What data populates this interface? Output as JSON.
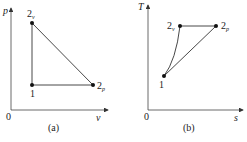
{
  "diagrams": [
    {
      "id": "a",
      "caption": "(a)",
      "y_axis_label": "p",
      "x_axis_label": "v",
      "origin_label": "0",
      "points": [
        {
          "name": "1",
          "base": "1",
          "sub": ""
        },
        {
          "name": "2v",
          "base": "2",
          "sub": "v"
        },
        {
          "name": "2p",
          "base": "2",
          "sub": "p"
        }
      ]
    },
    {
      "id": "b",
      "caption": "(b)",
      "y_axis_label": "T",
      "x_axis_label": "s",
      "origin_label": "0",
      "points": [
        {
          "name": "1",
          "base": "1",
          "sub": ""
        },
        {
          "name": "2v",
          "base": "2",
          "sub": "v"
        },
        {
          "name": "2p",
          "base": "2",
          "sub": "p"
        }
      ]
    }
  ],
  "colors": {
    "line": "#333333",
    "point": "#111111"
  }
}
